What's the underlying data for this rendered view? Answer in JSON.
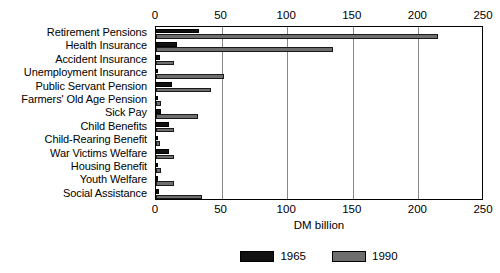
{
  "chart_data": {
    "type": "bar",
    "orientation": "horizontal",
    "title": "",
    "xlabel": "DM billion",
    "ylabel": "",
    "xlim": [
      0,
      250
    ],
    "xticks": [
      0,
      50,
      100,
      150,
      200,
      250
    ],
    "xtick_labels": [
      "0",
      "50",
      "100",
      "150",
      "200",
      "250"
    ],
    "grid": "vertical",
    "legend_position": "bottom-center",
    "categories": [
      "Retirement Pensions",
      "Health Insurance",
      "Accident Insurance",
      "Unemployment Insurance",
      "Public Servant Pension",
      "Farmers' Old Age Pension",
      "Sick Pay",
      "Child Benefits",
      "Child-Rearing Benefit",
      "War Victims Welfare",
      "Housing Benefit",
      "Youth Welfare",
      "Social Assistance"
    ],
    "series": [
      {
        "name": "1965",
        "color": "#111111",
        "values": [
          33,
          16,
          3,
          1,
          12,
          1,
          4,
          10,
          0,
          10,
          1,
          1,
          2
        ]
      },
      {
        "name": "1990",
        "color": "#6e6e6e",
        "values": [
          215,
          135,
          14,
          52,
          42,
          4,
          32,
          14,
          3,
          14,
          4,
          14,
          35
        ]
      }
    ]
  },
  "legend": {
    "items": [
      {
        "label": "1965",
        "color": "#111111"
      },
      {
        "label": "1990",
        "color": "#6e6e6e"
      }
    ]
  }
}
